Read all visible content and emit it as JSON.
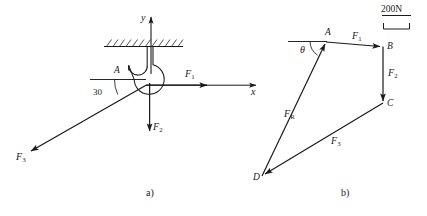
{
  "figure": {
    "captions": {
      "left": "a)",
      "right": "b)"
    }
  },
  "diagram_a": {
    "name": "hook-free-body-diagram",
    "axes": {
      "x_label": "x",
      "y_label": "y"
    },
    "point_labels": {
      "A": "A"
    },
    "angle": {
      "value": "30",
      "unit": "°"
    },
    "forces": [
      {
        "symbol": "F",
        "subscript": "1",
        "direction": "right"
      },
      {
        "symbol": "F",
        "subscript": "2",
        "direction": "down"
      },
      {
        "symbol": "F",
        "subscript": "3",
        "direction": "down-left-30deg"
      }
    ],
    "support": "hatched-ceiling"
  },
  "diagram_b": {
    "name": "force-polygon",
    "scale_bar": {
      "label": "200N"
    },
    "vertices": [
      "A",
      "B",
      "C",
      "D"
    ],
    "angle": {
      "symbol": "θ"
    },
    "forces": [
      {
        "symbol": "F",
        "subscript": "1",
        "from": "A",
        "to": "B"
      },
      {
        "symbol": "F",
        "subscript": "2",
        "from": "B",
        "to": "C"
      },
      {
        "symbol": "F",
        "subscript": "3",
        "from": "C",
        "to": "D"
      },
      {
        "symbol": "F",
        "subscript": "R",
        "from": "D",
        "to": "A"
      }
    ]
  },
  "style": {
    "stroke": "#1a1a1a",
    "background": "#ffffff"
  }
}
